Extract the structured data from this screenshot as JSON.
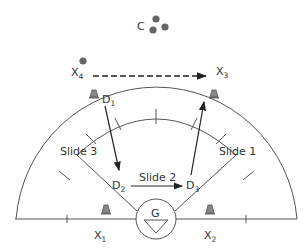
{
  "diagram": {
    "type": "hockey/lacrosse defensive zone drill",
    "labels": {
      "coach": "C",
      "x4": {
        "base": "X",
        "sub": "4"
      },
      "x3": {
        "base": "X",
        "sub": "3"
      },
      "x1": {
        "base": "X",
        "sub": "1"
      },
      "x2": {
        "base": "X",
        "sub": "2"
      },
      "d1": {
        "base": "D",
        "sub": "1"
      },
      "d2": {
        "base": "D",
        "sub": "2"
      },
      "d3": {
        "base": "D",
        "sub": "3"
      },
      "goalie": "G",
      "slide1": "Slide 1",
      "slide2": "Slide 2",
      "slide3": "Slide 3"
    },
    "elements": {
      "balls_near_coach": 3,
      "ball_near_x4": 1,
      "cones": 4,
      "pass_arrow": "X4 to X3 (dashed)",
      "move_arrows": [
        "D1 to D2",
        "D2 to D3 (Slide 2)",
        "D3 upward toward X3"
      ]
    },
    "colors": {
      "line": "#555555",
      "arrow": "#222222",
      "ball": "#666666",
      "cone": "#777777",
      "text": "#333333"
    }
  }
}
